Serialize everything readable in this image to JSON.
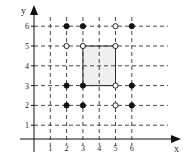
{
  "diagram": {
    "type": "coordinate-grid-lattice",
    "axes": {
      "x_label": "x",
      "y_label": "y",
      "x_ticks": [
        "1",
        "2",
        "3",
        "4",
        "5",
        "6"
      ],
      "y_ticks": [
        "1",
        "2",
        "3",
        "4",
        "5",
        "6"
      ]
    },
    "grid": {
      "style": "dashed",
      "x_range": [
        1,
        6
      ],
      "y_range": [
        1,
        6
      ]
    },
    "shaded_region": {
      "x_from": 3,
      "x_to": 5,
      "y_from": 3,
      "y_to": 5,
      "fill": "#efefef",
      "border": "solid"
    },
    "points": [
      {
        "x": 2,
        "y": 6,
        "style": "filled"
      },
      {
        "x": 3,
        "y": 6,
        "style": "filled"
      },
      {
        "x": 5,
        "y": 6,
        "style": "open"
      },
      {
        "x": 6,
        "y": 6,
        "style": "filled"
      },
      {
        "x": 2,
        "y": 5,
        "style": "open"
      },
      {
        "x": 3,
        "y": 5,
        "style": "open"
      },
      {
        "x": 5,
        "y": 5,
        "style": "open"
      },
      {
        "x": 2,
        "y": 3,
        "style": "filled"
      },
      {
        "x": 3,
        "y": 3,
        "style": "filled"
      },
      {
        "x": 5,
        "y": 3,
        "style": "open"
      },
      {
        "x": 6,
        "y": 3,
        "style": "filled"
      },
      {
        "x": 2,
        "y": 2,
        "style": "filled"
      },
      {
        "x": 3,
        "y": 2,
        "style": "filled"
      },
      {
        "x": 5,
        "y": 2,
        "style": "open"
      },
      {
        "x": 6,
        "y": 2,
        "style": "filled"
      }
    ],
    "colors": {
      "ink": "#111111",
      "grid": "#333333",
      "shade": "#efefef"
    }
  }
}
